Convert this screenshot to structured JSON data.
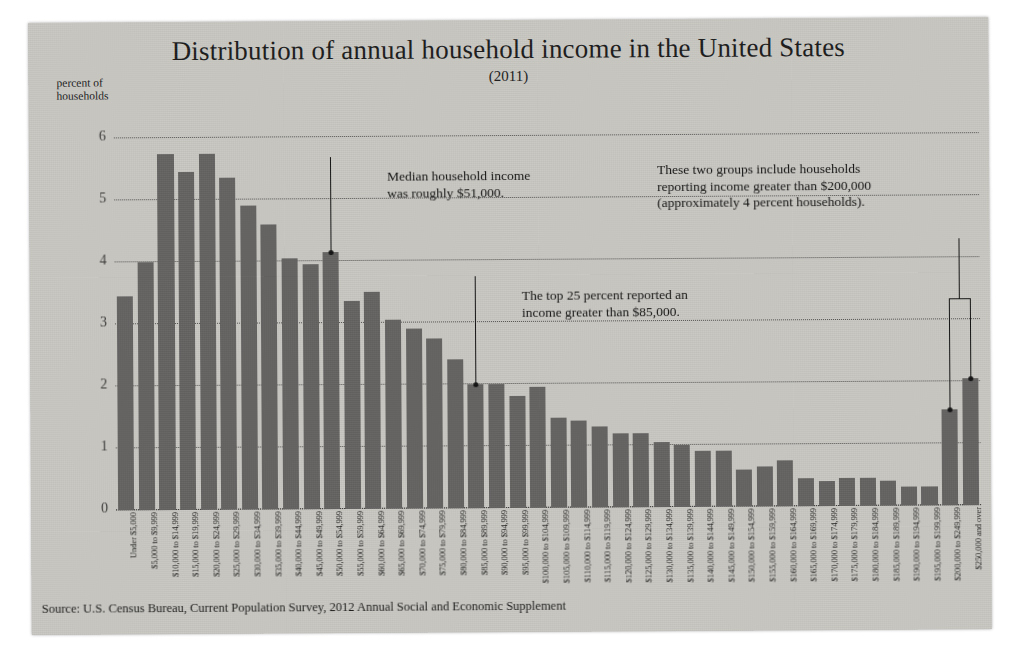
{
  "chart_data": {
    "type": "bar",
    "title": "Distribution of annual household income in the United States",
    "subtitle": "(2011)",
    "ylabel": "percent of\nhouseholds",
    "xlabel": "",
    "ylim": [
      0,
      6
    ],
    "yticks": [
      0,
      1,
      2,
      3,
      4,
      5,
      6
    ],
    "grid": true,
    "legend": "none",
    "source": "Source: U.S. Census Bureau, Current Population Survey, 2012 Annual Social and Economic Supplement",
    "bar_color": "#646362",
    "categories": [
      "Under $5,000",
      "$5,000 to $9,999",
      "$10,000 to $14,999",
      "$15,000 to $19,999",
      "$20,000 to $24,999",
      "$25,000 to $29,999",
      "$30,000 to $34,999",
      "$35,000 to $39,999",
      "$40,000 to $44,999",
      "$45,000 to $49,999",
      "$50,000 to $54,999",
      "$55,000 to $59,999",
      "$60,000 to $64,999",
      "$65,000 to $69,999",
      "$70,000 to $74,999",
      "$75,000 to $79,999",
      "$80,000 to $84,999",
      "$85,000 to $89,999",
      "$90,000 to $94,999",
      "$95,000 to $99,999",
      "$100,000 to $104,999",
      "$105,000 to $109,999",
      "$110,000 to $114,999",
      "$115,000 to $119,999",
      "$120,000 to $124,999",
      "$125,000 to $129,999",
      "$130,000 to $134,999",
      "$135,000 to $139,999",
      "$140,000 to $144,999",
      "$145,000 to $149,999",
      "$150,000 to $154,999",
      "$155,000 to $159,999",
      "$160,000 to $164,999",
      "$165,000 to $169,999",
      "$170,000 to $174,999",
      "$175,000 to $179,999",
      "$180,000 to $184,999",
      "$185,000 to $189,999",
      "$190,000 to $194,999",
      "$195,000 to $199,999",
      "$200,000 to $249,999",
      "$250,000 and over"
    ],
    "values": [
      3.45,
      4.0,
      5.75,
      5.45,
      5.75,
      5.35,
      4.9,
      4.6,
      4.05,
      3.95,
      4.15,
      3.35,
      3.5,
      3.05,
      2.9,
      2.75,
      2.4,
      2.0,
      2.0,
      1.8,
      1.95,
      1.45,
      1.4,
      1.3,
      1.2,
      1.2,
      1.05,
      1.0,
      0.9,
      0.9,
      0.6,
      0.65,
      0.75,
      0.45,
      0.4,
      0.45,
      0.45,
      0.4,
      0.3,
      0.3,
      1.55,
      2.05
    ],
    "bar_styles": [
      "filled",
      "filled",
      "filled",
      "filled",
      "filled",
      "filled",
      "filled",
      "filled",
      "filled",
      "filled",
      "filled",
      "filled",
      "filled",
      "filled",
      "filled",
      "filled",
      "filled",
      "filled",
      "filled",
      "filled",
      "filled",
      "filled",
      "filled",
      "filled",
      "filled",
      "filled",
      "filled",
      "filled",
      "filled",
      "filled",
      "filled",
      "filled",
      "filled",
      "filled",
      "filled",
      "filled",
      "filled",
      "filled",
      "filled",
      "filled",
      "filled",
      "filled"
    ],
    "annotations": [
      {
        "id": "median",
        "text": "Median household income was roughly $51,000.",
        "line1": "Median household income",
        "line2": "was roughly $51,000.",
        "points_to_category": "$50,000 to $54,999",
        "points_to_value": 4.15
      },
      {
        "id": "top25",
        "text": "The top 25 percent reported an income greater than $85,000.",
        "line1": "The top 25 percent reported an",
        "line2": "income greater than $85,000.",
        "points_to_category": "$85,000 to $89,999",
        "points_to_value": 2.0
      },
      {
        "id": "over200k",
        "text": "These two groups include households reporting income greater than $200,000 (approximately 4 percent households).",
        "line1": "These two groups include households",
        "line2": "reporting income greater than $200,000",
        "line3": "(approximately 4 percent households).",
        "points_to_categories": [
          "$200,000 to $249,999",
          "$250,000 and over"
        ]
      }
    ]
  }
}
